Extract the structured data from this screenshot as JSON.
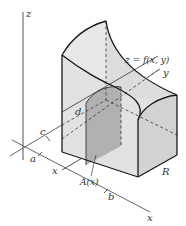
{
  "figure": {
    "type": "3D volume by cross-sections diagram",
    "axes": {
      "x_label": "x",
      "y_label": "y",
      "z_label": "z"
    },
    "surface_label": "z = f(x, y)",
    "cross_section_label": "A(x)",
    "region_label": "R",
    "tick_labels": {
      "a": "a",
      "b": "b",
      "c": "c",
      "d": "d",
      "x": "x"
    },
    "colors": {
      "solid_fill": "#e4e4e4",
      "solid_side": "#d6d6d6",
      "cross_section_fill": "#a9a9a9",
      "edge": "#1a1a1a",
      "axis": "#333333",
      "background": "#ffffff"
    }
  }
}
